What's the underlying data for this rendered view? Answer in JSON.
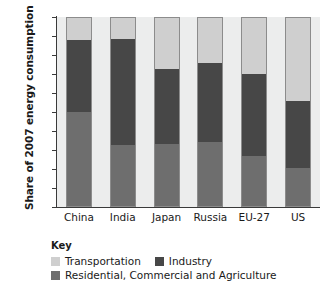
{
  "chart_data": {
    "type": "bar",
    "stacked": true,
    "title": "",
    "xlabel": "",
    "ylabel": "Share of 2007 energy consumption",
    "categories": [
      "China",
      "India",
      "Japan",
      "Russia",
      "EU-27",
      "US"
    ],
    "ylim": [
      0,
      100
    ],
    "ytick_labels": [
      "0%",
      "10%",
      "20%",
      "30%",
      "40%",
      "50%",
      "60%",
      "70%",
      "80%",
      "90%",
      "100%"
    ],
    "ytick_values": [
      0,
      10,
      20,
      30,
      40,
      50,
      60,
      70,
      80,
      90,
      100
    ],
    "grid": false,
    "legend_position": "below",
    "legend_title": "Key",
    "series": [
      {
        "name": "Residential, Commercial and Agriculture",
        "color": "#6e6e6e",
        "values": [
          50,
          32.5,
          33,
          34,
          27,
          20.5
        ]
      },
      {
        "name": "Industry",
        "color": "#474747",
        "values": [
          38,
          56,
          39.5,
          42,
          43,
          35.5
        ]
      },
      {
        "name": "Transportation",
        "color": "#cfcfcf",
        "values": [
          12,
          11.5,
          27.5,
          24,
          30,
          44
        ]
      }
    ],
    "cumulative_tops": {
      "Residential, Commercial and Agriculture": [
        50,
        32.5,
        33,
        34,
        27,
        20.5
      ],
      "Industry": [
        88,
        88.5,
        72.5,
        76,
        70,
        56
      ],
      "Transportation": [
        100,
        100,
        100,
        100,
        100,
        100
      ]
    },
    "plot_background": "#eceded",
    "bar_border": "#8c8c8c",
    "axis_color": "#3a3a3a"
  },
  "legend": {
    "title": "Key",
    "row1": [
      {
        "label": "Transportation",
        "color": "#cfcfcf"
      },
      {
        "label": "Industry",
        "color": "#474747"
      }
    ],
    "row2": [
      {
        "label": "Residential, Commercial and Agriculture",
        "color": "#6e6e6e"
      }
    ]
  }
}
